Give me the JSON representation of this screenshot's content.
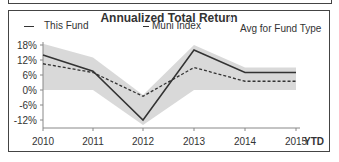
{
  "chart_data": {
    "type": "line",
    "title": "Annualized Total Return",
    "categories": [
      "2010",
      "2011",
      "2012",
      "2013",
      "2014",
      "2015"
    ],
    "x_suffix_label": "YTD",
    "series": [
      {
        "name": "This Fund",
        "style": "solid",
        "values": [
          14,
          7.5,
          -12,
          16,
          7,
          7
        ]
      },
      {
        "name": "Muni Index",
        "style": "dashed",
        "values": [
          10.5,
          7,
          -2.5,
          9,
          3.5,
          3.5
        ]
      },
      {
        "name": "Avg for Fund Type",
        "style": "band",
        "upper": [
          18.5,
          13,
          -2,
          18,
          9,
          9
        ],
        "lower": [
          0,
          0,
          -14,
          0,
          0,
          0
        ]
      }
    ],
    "yticks": [
      "18%",
      "12%",
      "6%",
      "0%",
      "-6%",
      "-12%"
    ],
    "ytick_values": [
      18,
      12,
      6,
      0,
      -6,
      -12
    ],
    "ylim": [
      -15.5,
      18.5
    ],
    "xlabel": "",
    "ylabel": "",
    "grid": false,
    "legend_position": "top"
  },
  "legend": {
    "fund": "This Fund",
    "muni": "Muni Index",
    "avg": "Avg for Fund Type"
  },
  "colors": {
    "fund": "#333333",
    "muni": "#333333",
    "band": "#d9d9d9",
    "axis": "#888888"
  }
}
